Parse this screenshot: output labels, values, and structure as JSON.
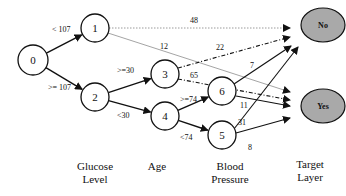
{
  "nodes": [
    {
      "id": "0",
      "label": "0",
      "cx": 33,
      "cy": 60,
      "r": 15
    },
    {
      "id": "1",
      "label": "1",
      "cx": 95,
      "cy": 28,
      "r": 14
    },
    {
      "id": "2",
      "label": "2",
      "cx": 95,
      "cy": 97,
      "r": 14
    },
    {
      "id": "3",
      "label": "3",
      "cx": 165,
      "cy": 74,
      "r": 14
    },
    {
      "id": "4",
      "label": "4",
      "cx": 165,
      "cy": 116,
      "r": 14
    },
    {
      "id": "6",
      "label": "6",
      "cx": 222,
      "cy": 91,
      "r": 14
    },
    {
      "id": "5",
      "label": "5",
      "cx": 222,
      "cy": 135,
      "r": 14
    }
  ],
  "targets": [
    {
      "id": "no",
      "label": "No",
      "cx": 323,
      "cy": 25,
      "rx": 22,
      "ry": 17,
      "fill": "#a9a9a9"
    },
    {
      "id": "yes",
      "label": "Yes",
      "cx": 323,
      "cy": 106,
      "rx": 22,
      "ry": 17,
      "fill": "#a9a9a9"
    }
  ],
  "split_edges": [
    {
      "from": "0",
      "to": "1",
      "label": "< 107",
      "lx": 52,
      "ly": 32
    },
    {
      "from": "0",
      "to": "2",
      "label": ">= 107",
      "lx": 48,
      "ly": 90
    },
    {
      "from": "2",
      "to": "3",
      "label": ">=30",
      "lx": 117,
      "ly": 73
    },
    {
      "from": "2",
      "to": "4",
      "label": "<30",
      "lx": 117,
      "ly": 118
    },
    {
      "from": "4",
      "to": "6",
      "label": ">=74",
      "lx": 180,
      "ly": 102
    },
    {
      "from": "4",
      "to": "5",
      "label": "<74",
      "lx": 180,
      "ly": 140
    }
  ],
  "weight_edges": [
    {
      "from": "1",
      "to": "no",
      "weight": "48",
      "style": "dotted",
      "x1": 109,
      "y1": 28,
      "x2": 290,
      "y2": 28,
      "lx": 190,
      "ly": 23
    },
    {
      "from": "1",
      "to": "yes",
      "weight": "12",
      "style": "thin",
      "x1": 108,
      "y1": 33,
      "x2": 290,
      "y2": 92,
      "lx": 160,
      "ly": 49
    },
    {
      "from": "3",
      "to": "no",
      "weight": "22",
      "style": "dashdot",
      "x1": 178,
      "y1": 68,
      "x2": 290,
      "y2": 37,
      "lx": 216,
      "ly": 50
    },
    {
      "from": "3",
      "to": "yes",
      "weight": "65",
      "style": "dashdot",
      "x1": 178,
      "y1": 79,
      "x2": 290,
      "y2": 100,
      "lx": 190,
      "ly": 78
    },
    {
      "from": "6",
      "to": "no",
      "weight": "7",
      "style": "solid",
      "x1": 234,
      "y1": 84,
      "x2": 291,
      "y2": 46,
      "lx": 250,
      "ly": 68
    },
    {
      "from": "6",
      "to": "yes",
      "weight": "11",
      "style": "solid",
      "x1": 236,
      "y1": 96,
      "x2": 290,
      "y2": 106,
      "lx": 240,
      "ly": 108
    },
    {
      "from": "5",
      "to": "no",
      "weight": "31",
      "style": "solid",
      "x1": 234,
      "y1": 129,
      "x2": 298,
      "y2": 47,
      "lx": 238,
      "ly": 125
    },
    {
      "from": "5",
      "to": "yes",
      "weight": "8",
      "style": "solid",
      "x1": 236,
      "y1": 133,
      "x2": 290,
      "y2": 118,
      "lx": 248,
      "ly": 150
    }
  ],
  "layers": [
    {
      "id": "glucose",
      "line1": "Glucose",
      "line2": "Level",
      "x": 95
    },
    {
      "id": "age",
      "line1": "Age",
      "line2": "",
      "x": 157
    },
    {
      "id": "bp",
      "line1": "Blood",
      "line2": "Pressure",
      "x": 230
    },
    {
      "id": "target",
      "line1": "Target",
      "line2": "Layer",
      "x": 310
    }
  ],
  "colors": {
    "stroke": "#111111",
    "light_edge": "#9a9a9a",
    "target_fill": "#a9a9a9"
  }
}
